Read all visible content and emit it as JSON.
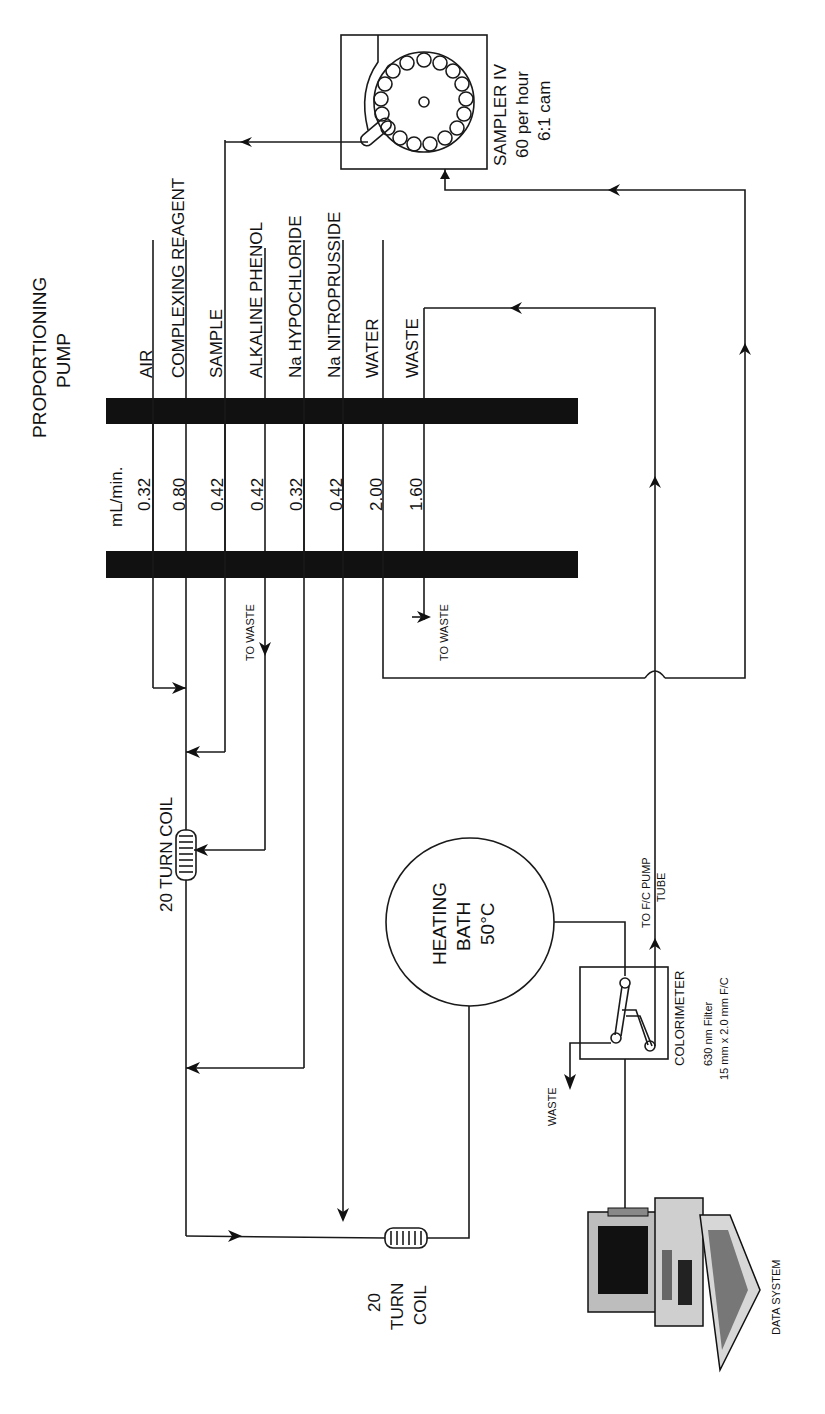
{
  "pump": {
    "title_line1": "PROPORTIONING",
    "title_line2": "PUMP",
    "unit": "mL/min.",
    "channels": [
      {
        "name": "AIR",
        "rate": "0.32"
      },
      {
        "name": "COMPLEXING REAGENT",
        "rate": "0.80"
      },
      {
        "name": "SAMPLE",
        "rate": "0.42"
      },
      {
        "name": "ALKALINE PHENOL",
        "rate": "0.42"
      },
      {
        "name": "Na HYPOCHLORIDE",
        "rate": "0.32"
      },
      {
        "name": "Na NITROPRUSSIDE",
        "rate": "0.42"
      },
      {
        "name": "WATER",
        "rate": "2.00"
      },
      {
        "name": "WASTE",
        "rate": "1.60"
      }
    ]
  },
  "sampler": {
    "line1": "SAMPLER IV",
    "line2": "60 per hour",
    "line3": "6:1 cam"
  },
  "coil1": {
    "label": "20 TURN COIL"
  },
  "coil2": {
    "line1": "20",
    "line2": "TURN",
    "line3": "COIL"
  },
  "to_waste_1": "TO WASTE",
  "to_waste_2": "TO WASTE",
  "heating_bath": {
    "line1": "HEATING",
    "line2": "BATH",
    "line3": "50°C"
  },
  "colorimeter": {
    "label": "COLORIMETER",
    "spec1": "630 nm Filter",
    "spec2": "15 mm x 2.0 mm F/C"
  },
  "fc_pump": {
    "line1": "TO F/C PUMP",
    "line2": "TUBE"
  },
  "waste_label": "WASTE",
  "data_system": "DATA SYSTEM"
}
